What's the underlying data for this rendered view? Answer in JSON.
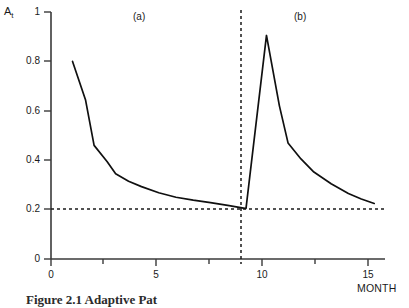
{
  "figure": {
    "y_axis_label": "A",
    "y_axis_label_sub": "t",
    "x_axis_label": "MONTH",
    "panel_a": "(a)",
    "panel_b": "(b)",
    "caption": "Figure 2.1 Adaptive  Pat"
  },
  "chart_data": {
    "type": "line",
    "title": "",
    "xlabel": "MONTH",
    "ylabel": "A_t",
    "xlim": [
      0,
      15.5
    ],
    "ylim": [
      0,
      1
    ],
    "xticks": [
      "0",
      "5",
      "10",
      "15"
    ],
    "xtick_values": [
      0,
      5,
      10,
      15
    ],
    "yticks": [
      "0",
      "0.2",
      "0.4",
      "0.6",
      "0.8",
      "1"
    ],
    "ytick_values": [
      0,
      0.2,
      0.4,
      0.6,
      0.8,
      1
    ],
    "grid": false,
    "legend": false,
    "annotations": [
      {
        "text": "(a)",
        "x": 3.7,
        "y": 0.97
      },
      {
        "text": "(b)",
        "x": 11.3,
        "y": 0.97
      }
    ],
    "reference_lines": [
      {
        "name": "asymptote",
        "orientation": "horizontal",
        "value": 0.2,
        "style": "dashed"
      },
      {
        "name": "regime-divider",
        "orientation": "vertical",
        "value": 9,
        "style": "dashed"
      }
    ],
    "series": [
      {
        "name": "Adaptation level A_t",
        "style": "solid",
        "x": [
          1,
          1.6,
          2,
          2.6,
          3,
          3.6,
          4.2,
          5,
          5.8,
          6.6,
          7.4,
          8.2,
          9,
          9.05,
          10,
          10.6,
          11,
          11.6,
          12.2,
          13,
          13.8,
          14.4,
          15
        ],
        "values": [
          0.8,
          0.645,
          0.46,
          0.395,
          0.345,
          0.315,
          0.293,
          0.268,
          0.25,
          0.238,
          0.228,
          0.217,
          0.205,
          0.205,
          0.905,
          0.62,
          0.47,
          0.405,
          0.352,
          0.305,
          0.265,
          0.243,
          0.225
        ]
      }
    ]
  }
}
